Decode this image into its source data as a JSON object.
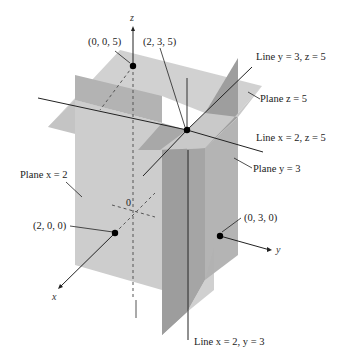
{
  "figure": {
    "axes": {
      "x_label": "x",
      "y_label": "y",
      "z_label": "z",
      "origin_label": "0"
    },
    "points": [
      {
        "id": "p005",
        "label": "(0, 0, 5)"
      },
      {
        "id": "p235",
        "label": "(2, 3, 5)"
      },
      {
        "id": "p200",
        "label": "(2, 0, 0)"
      },
      {
        "id": "p030",
        "label": "(0, 3, 0)"
      }
    ],
    "planes": [
      {
        "id": "plane-x2",
        "label": "Plane x = 2",
        "color": "#c8c8c8"
      },
      {
        "id": "plane-y3",
        "label": "Plane y = 3",
        "color": "#a9a9a9"
      },
      {
        "id": "plane-z5",
        "label": "Plane z = 5",
        "color": "#bdbdbd"
      }
    ],
    "lines": [
      {
        "id": "line-y3z5",
        "label": "Line y = 3, z = 5"
      },
      {
        "id": "line-x2z5",
        "label": "Line x = 2, z = 5"
      },
      {
        "id": "line-x2y3",
        "label": "Line x = 2, y = 3"
      }
    ],
    "colors": {
      "background": "#ffffff",
      "plane_light": "#cfcfcf",
      "plane_mid": "#b8b8b8",
      "plane_dark": "#9c9c9c",
      "line": "#222222"
    }
  }
}
